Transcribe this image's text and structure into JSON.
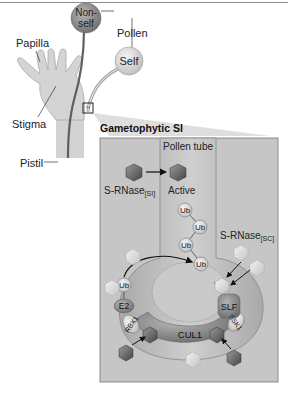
{
  "figure": {
    "overview": {
      "labels": {
        "papilla": "Papilla",
        "stigma": "Stigma",
        "pistil": "Pistil",
        "pollen": "Pollen",
        "nonself_line1": "Non-",
        "nonself_line2": "self",
        "self": "Self"
      }
    },
    "inset": {
      "title": "Gametophytic SI",
      "pollen_tube_label": "Pollen tube",
      "srnase_si_label": "S-RNase",
      "srnase_si_sub": "[SI]",
      "active_label": "Active",
      "srnase_sc_label": "S-RNase",
      "srnase_sc_sub": "[SC]",
      "ub_label": "Ub",
      "complex": {
        "e2": "E2",
        "rbx1": "RBX1",
        "cul1": "CUL1",
        "ssk1": "SSK1",
        "slf": "SLF",
        "ub": "Ub"
      }
    },
    "colors": {
      "panel_fill": "#c8c8c8",
      "tube_fill": "#b4b4b4",
      "dark_node": "#7a7a7a",
      "light_node": "#dcdcdc",
      "dark_hex": "#5a5a5a",
      "light_hex": "#dedede"
    }
  }
}
